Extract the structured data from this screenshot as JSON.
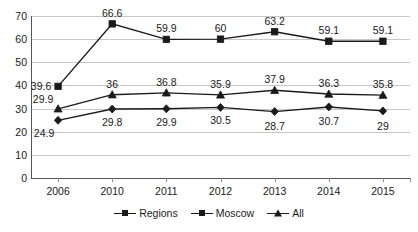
{
  "chart_data": {
    "type": "line",
    "title": "",
    "subtitle": "",
    "xlabel": "",
    "ylabel": "",
    "categories": [
      "2006",
      "2010",
      "2011",
      "2012",
      "2013",
      "2014",
      "2015"
    ],
    "ylim": [
      0,
      70
    ],
    "ytick_step": 10,
    "yticks": [
      "70",
      "60",
      "50",
      "40",
      "30",
      "20",
      "10",
      "0"
    ],
    "grid": "horizontal",
    "legend_position": "bottom-center",
    "series": [
      {
        "name": "Regions",
        "marker": "diamond",
        "color": "#1a1a1a",
        "values": [
          24.9,
          29.8,
          29.9,
          30.5,
          28.7,
          30.7,
          29
        ],
        "labels": [
          "24.9",
          "29.8",
          "29.9",
          "30.5",
          "28.7",
          "30.7",
          "29"
        ]
      },
      {
        "name": "Moscow",
        "marker": "square",
        "color": "#1a1a1a",
        "values": [
          39.6,
          66.6,
          59.9,
          60,
          63.2,
          59.1,
          59.1
        ],
        "labels": [
          "39.6",
          "66.6",
          "59.9",
          "60",
          "63.2",
          "59.1",
          "59.1"
        ]
      },
      {
        "name": "All",
        "marker": "triangle",
        "color": "#1a1a1a",
        "values": [
          29.9,
          36,
          36.8,
          35.9,
          37.9,
          36.3,
          35.8
        ],
        "labels": [
          "29.9",
          "36",
          "36.8",
          "35.9",
          "37.9",
          "36.3",
          "35.8"
        ]
      }
    ]
  },
  "legend": {
    "items": [
      {
        "label": "Regions",
        "marker": "diamond"
      },
      {
        "label": "Moscow",
        "marker": "square"
      },
      {
        "label": "All",
        "marker": "triangle"
      }
    ]
  }
}
